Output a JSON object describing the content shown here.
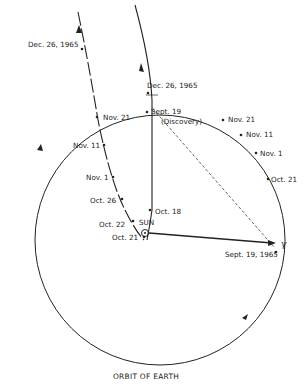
{
  "diagram": {
    "caption": "ORBIT OF EARTH",
    "sun_label": "SUN",
    "vernal_equinox_symbol": "γ",
    "earth_positions": [
      {
        "label": "Dec. 26, 1965"
      },
      {
        "label": "Nov. 21"
      },
      {
        "label": "Nov. 11"
      },
      {
        "label": "Nov. 1"
      },
      {
        "label": "Oct. 21"
      },
      {
        "label": "Sept. 19, 1965"
      }
    ],
    "comet_positions": [
      {
        "label": "Dec. 26, 1965"
      },
      {
        "label": "Nov. 21"
      },
      {
        "label": "Nov. 11"
      },
      {
        "label": "Nov. 1"
      },
      {
        "label": "Oct. 26"
      },
      {
        "label": "Oct. 22"
      },
      {
        "label": "Oct. 21"
      },
      {
        "label": "Oct. 18"
      },
      {
        "label": "Sept. 19"
      },
      {
        "label": "(Discovery)"
      }
    ]
  }
}
